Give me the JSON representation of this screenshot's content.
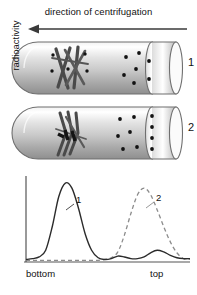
{
  "header": {
    "caption": "direction of centrifugation",
    "arrow_icon": "left-arrow-icon",
    "arrow_direction": "left"
  },
  "tubes": [
    {
      "index_label": "1",
      "name": "centrifuge-tube-1",
      "contents": "intact cross-shaped chromosome rods near the bottom (left) end",
      "particle_count": 7,
      "particle_color": "#111111"
    },
    {
      "index_label": "2",
      "name": "centrifuge-tube-2",
      "contents": "elongated stretched strands with dark segments near the bottom (left) end",
      "particle_count": 10,
      "particle_color": "#111111"
    }
  ],
  "colors": {
    "tube_outline": "#6f6f6f",
    "tube_fill_light": "#ffffff",
    "tube_fill_mid": "#d8d8d8",
    "tube_fill_dark": "#9a9a9a",
    "curve_1": "#2b2b2b",
    "curve_2": "#8c8c8c",
    "axis": "#555555",
    "text": "#111111"
  },
  "chart_data": {
    "type": "line",
    "title": "",
    "xlabel": "",
    "ylabel": "radioactivity",
    "xlim": [
      0,
      100
    ],
    "ylim": [
      0,
      100
    ],
    "grid": false,
    "legend_position": "inline-annotations",
    "x_tick_labels": [
      "bottom",
      "top"
    ],
    "x_tick_positions": [
      0,
      100
    ],
    "y_tick_labels": [],
    "annotations": [
      {
        "text": "1",
        "x": 38,
        "y": 68,
        "series": "1"
      },
      {
        "text": "2",
        "x": 83,
        "y": 72,
        "series": "2"
      }
    ],
    "x": [
      0,
      4,
      8,
      12,
      16,
      20,
      24,
      28,
      32,
      36,
      40,
      44,
      48,
      52,
      56,
      60,
      64,
      68,
      72,
      76,
      80,
      84,
      88,
      92,
      96,
      100
    ],
    "series": [
      {
        "name": "1",
        "style": "solid",
        "color": "#2b2b2b",
        "values": [
          3,
          4,
          6,
          14,
          42,
          78,
          94,
          88,
          64,
          34,
          14,
          5,
          3,
          4,
          7,
          6,
          4,
          4,
          6,
          11,
          14,
          12,
          8,
          5,
          4,
          4
        ]
      },
      {
        "name": "2",
        "style": "dashed",
        "color": "#8c8c8c",
        "values": [
          2,
          2,
          2,
          2,
          2,
          2,
          2,
          2,
          2,
          2,
          2,
          2,
          3,
          5,
          12,
          32,
          58,
          80,
          88,
          80,
          62,
          42,
          24,
          11,
          4,
          3
        ]
      }
    ]
  }
}
